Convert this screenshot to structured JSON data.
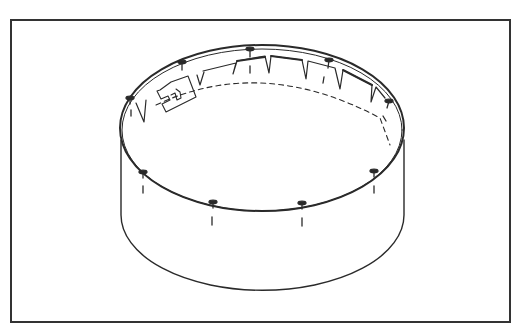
{
  "figure": {
    "frame_color": "#333333",
    "line_color": "#2a2a2a",
    "background": "#ffffff"
  },
  "pool": {
    "top_rim": {
      "cx": 262,
      "cy": 130,
      "rx": 142,
      "ry": 85
    },
    "wall_height": 92,
    "caps_top": [
      {
        "x": 130,
        "y": 98
      },
      {
        "x": 182,
        "y": 62
      },
      {
        "x": 250,
        "y": 49
      },
      {
        "x": 329,
        "y": 60
      },
      {
        "x": 389,
        "y": 101
      }
    ],
    "caps_front": [
      {
        "x": 143,
        "y": 172
      },
      {
        "x": 213,
        "y": 202
      },
      {
        "x": 302,
        "y": 203
      },
      {
        "x": 374,
        "y": 171
      }
    ],
    "skimmer": {
      "label": "skimmer-bracket"
    }
  }
}
